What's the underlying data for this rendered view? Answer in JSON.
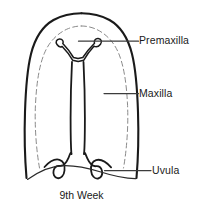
{
  "figure": {
    "caption": "9th Week",
    "labels": [
      {
        "id": "premaxilla",
        "text": "Premaxilla"
      },
      {
        "id": "maxilla",
        "text": "Maxilla"
      },
      {
        "id": "uvula",
        "text": "Uvula"
      }
    ],
    "colors": {
      "background": "#ffffff",
      "outline": "#1a1a1a",
      "inner_dashed": "#7a7a7a",
      "leader_line": "#3c3c3c",
      "text": "#1a1a1a"
    },
    "parts": {
      "outer_outline": "palate-outer-contour",
      "inner_dashed_outline": "palatal-shelf-dashed-contour",
      "premaxilla_shape": "y-shaped-premaxilla-bone",
      "cleft": "median-palatal-cleft",
      "uvula_left": "left-uvula-lobe",
      "uvula_right": "right-uvula-lobe",
      "pharynx_curve": "posterior-pharyngeal-curve"
    }
  }
}
